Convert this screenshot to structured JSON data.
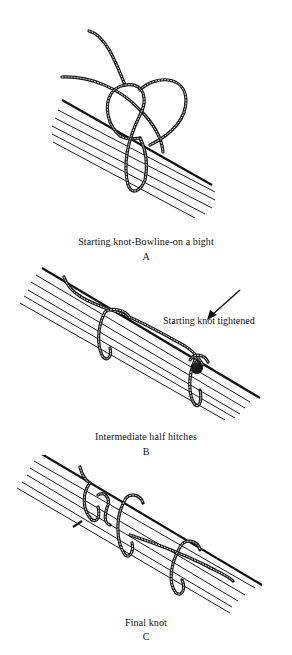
{
  "figure": {
    "panels": [
      {
        "id": "A",
        "caption": "Starting knot-Bowline-on a bight",
        "letter": "A"
      },
      {
        "id": "B",
        "caption": "Intermediate half hitches",
        "letter": "B",
        "callout": "Starting knot tightened"
      },
      {
        "id": "C",
        "caption": "Final knot",
        "letter": "C"
      }
    ]
  }
}
